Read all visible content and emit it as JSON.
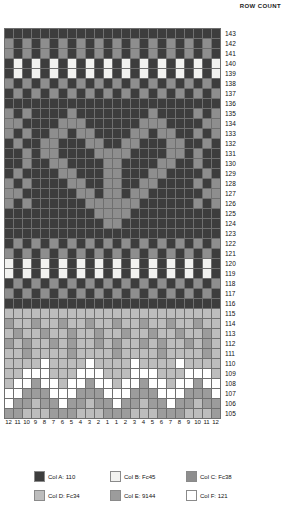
{
  "header": {
    "row_count_label": "ROW COUNT"
  },
  "chart_data": {
    "type": "heatmap",
    "title": "",
    "xlabel": "",
    "ylabel": "ROW COUNT",
    "grid": true,
    "legend_position": "bottom",
    "columns": 24,
    "rows": 39,
    "column_labels": [
      12,
      11,
      10,
      9,
      8,
      7,
      6,
      5,
      4,
      3,
      2,
      1,
      1,
      2,
      3,
      4,
      5,
      6,
      7,
      8,
      9,
      10,
      11,
      12
    ],
    "row_labels": [
      143,
      142,
      141,
      140,
      139,
      138,
      137,
      136,
      135,
      134,
      133,
      132,
      131,
      130,
      129,
      128,
      127,
      126,
      125,
      124,
      123,
      122,
      121,
      120,
      119,
      118,
      117,
      116,
      115,
      114,
      113,
      112,
      111,
      110,
      109,
      108,
      107,
      106,
      105
    ],
    "palette": {
      "A": "#3d3d3d",
      "B": "#f2f2f0",
      "C": "#8e8e8e",
      "D": "#bdbdbd",
      "E": "#9c9c9c",
      "F": "#ffffff"
    },
    "cells": [
      [
        "A",
        "A",
        "A",
        "A",
        "A",
        "A",
        "A",
        "A",
        "A",
        "A",
        "A",
        "A",
        "A",
        "A",
        "A",
        "A",
        "A",
        "A",
        "A",
        "A",
        "A",
        "A",
        "A",
        "A"
      ],
      [
        "C",
        "A",
        "C",
        "A",
        "C",
        "A",
        "C",
        "A",
        "C",
        "A",
        "C",
        "A",
        "C",
        "A",
        "C",
        "A",
        "C",
        "A",
        "C",
        "A",
        "C",
        "A",
        "C",
        "A"
      ],
      [
        "C",
        "A",
        "C",
        "A",
        "C",
        "A",
        "C",
        "A",
        "C",
        "A",
        "C",
        "A",
        "C",
        "A",
        "C",
        "A",
        "C",
        "A",
        "C",
        "A",
        "C",
        "A",
        "C",
        "A"
      ],
      [
        "A",
        "B",
        "A",
        "B",
        "A",
        "B",
        "A",
        "B",
        "A",
        "B",
        "A",
        "B",
        "A",
        "B",
        "A",
        "B",
        "A",
        "B",
        "A",
        "B",
        "A",
        "B",
        "A",
        "B"
      ],
      [
        "A",
        "B",
        "A",
        "B",
        "A",
        "B",
        "A",
        "B",
        "A",
        "B",
        "A",
        "B",
        "A",
        "B",
        "A",
        "B",
        "A",
        "B",
        "A",
        "B",
        "A",
        "B",
        "A",
        "B"
      ],
      [
        "C",
        "A",
        "C",
        "A",
        "C",
        "A",
        "C",
        "A",
        "C",
        "A",
        "C",
        "A",
        "C",
        "A",
        "C",
        "A",
        "C",
        "A",
        "C",
        "A",
        "C",
        "A",
        "C",
        "A"
      ],
      [
        "A",
        "C",
        "A",
        "C",
        "A",
        "C",
        "A",
        "C",
        "A",
        "C",
        "A",
        "C",
        "A",
        "C",
        "A",
        "C",
        "A",
        "C",
        "A",
        "C",
        "A",
        "C",
        "A",
        "C"
      ],
      [
        "A",
        "A",
        "A",
        "A",
        "A",
        "A",
        "A",
        "A",
        "A",
        "A",
        "A",
        "A",
        "A",
        "A",
        "A",
        "A",
        "A",
        "A",
        "A",
        "A",
        "A",
        "A",
        "A",
        "A"
      ],
      [
        "C",
        "A",
        "C",
        "A",
        "A",
        "A",
        "A",
        "C",
        "A",
        "A",
        "A",
        "A",
        "A",
        "A",
        "A",
        "A",
        "C",
        "A",
        "A",
        "A",
        "A",
        "C",
        "A",
        "C"
      ],
      [
        "C",
        "C",
        "A",
        "A",
        "A",
        "A",
        "C",
        "C",
        "C",
        "A",
        "A",
        "A",
        "A",
        "A",
        "A",
        "C",
        "C",
        "C",
        "A",
        "A",
        "A",
        "A",
        "C",
        "C"
      ],
      [
        "C",
        "A",
        "C",
        "A",
        "A",
        "C",
        "C",
        "A",
        "C",
        "C",
        "A",
        "A",
        "A",
        "A",
        "C",
        "C",
        "A",
        "C",
        "C",
        "A",
        "A",
        "C",
        "A",
        "C"
      ],
      [
        "A",
        "C",
        "A",
        "A",
        "C",
        "C",
        "A",
        "A",
        "A",
        "C",
        "C",
        "A",
        "A",
        "C",
        "C",
        "A",
        "A",
        "A",
        "C",
        "C",
        "A",
        "A",
        "C",
        "A"
      ],
      [
        "A",
        "A",
        "C",
        "A",
        "C",
        "C",
        "A",
        "A",
        "A",
        "A",
        "C",
        "C",
        "C",
        "C",
        "A",
        "A",
        "A",
        "A",
        "C",
        "C",
        "A",
        "C",
        "A",
        "A"
      ],
      [
        "A",
        "A",
        "C",
        "A",
        "A",
        "C",
        "C",
        "A",
        "A",
        "A",
        "A",
        "C",
        "C",
        "A",
        "A",
        "A",
        "A",
        "C",
        "C",
        "A",
        "A",
        "C",
        "A",
        "A"
      ],
      [
        "A",
        "C",
        "A",
        "A",
        "A",
        "A",
        "C",
        "C",
        "A",
        "A",
        "A",
        "C",
        "C",
        "A",
        "A",
        "A",
        "C",
        "C",
        "A",
        "A",
        "A",
        "A",
        "C",
        "A"
      ],
      [
        "C",
        "A",
        "C",
        "A",
        "A",
        "A",
        "A",
        "C",
        "C",
        "A",
        "A",
        "C",
        "C",
        "A",
        "A",
        "C",
        "C",
        "A",
        "A",
        "A",
        "A",
        "C",
        "A",
        "C"
      ],
      [
        "C",
        "C",
        "A",
        "A",
        "A",
        "A",
        "A",
        "A",
        "C",
        "C",
        "A",
        "C",
        "C",
        "A",
        "C",
        "C",
        "A",
        "A",
        "A",
        "A",
        "A",
        "A",
        "C",
        "C"
      ],
      [
        "C",
        "A",
        "C",
        "A",
        "A",
        "A",
        "A",
        "A",
        "A",
        "C",
        "C",
        "C",
        "C",
        "C",
        "C",
        "A",
        "A",
        "A",
        "A",
        "A",
        "A",
        "C",
        "A",
        "C"
      ],
      [
        "A",
        "A",
        "A",
        "A",
        "A",
        "A",
        "A",
        "A",
        "A",
        "A",
        "C",
        "C",
        "C",
        "C",
        "A",
        "A",
        "A",
        "A",
        "A",
        "A",
        "A",
        "A",
        "A",
        "A"
      ],
      [
        "A",
        "A",
        "A",
        "A",
        "A",
        "A",
        "A",
        "A",
        "A",
        "A",
        "A",
        "C",
        "C",
        "A",
        "A",
        "A",
        "A",
        "A",
        "A",
        "A",
        "A",
        "A",
        "A",
        "A"
      ],
      [
        "A",
        "A",
        "A",
        "A",
        "A",
        "A",
        "A",
        "A",
        "A",
        "A",
        "A",
        "A",
        "A",
        "A",
        "A",
        "A",
        "A",
        "A",
        "A",
        "A",
        "A",
        "A",
        "A",
        "A"
      ],
      [
        "A",
        "C",
        "A",
        "C",
        "A",
        "C",
        "A",
        "C",
        "A",
        "C",
        "A",
        "C",
        "A",
        "C",
        "A",
        "C",
        "A",
        "C",
        "A",
        "C",
        "A",
        "C",
        "A",
        "C"
      ],
      [
        "C",
        "A",
        "C",
        "A",
        "C",
        "A",
        "C",
        "A",
        "C",
        "A",
        "C",
        "A",
        "C",
        "A",
        "C",
        "A",
        "C",
        "A",
        "C",
        "A",
        "C",
        "A",
        "C",
        "A"
      ],
      [
        "B",
        "A",
        "B",
        "A",
        "B",
        "A",
        "B",
        "A",
        "B",
        "A",
        "B",
        "A",
        "B",
        "A",
        "B",
        "A",
        "B",
        "A",
        "B",
        "A",
        "B",
        "A",
        "B",
        "A"
      ],
      [
        "B",
        "A",
        "B",
        "A",
        "B",
        "A",
        "B",
        "A",
        "B",
        "A",
        "B",
        "A",
        "B",
        "A",
        "B",
        "A",
        "B",
        "A",
        "B",
        "A",
        "B",
        "A",
        "B",
        "A"
      ],
      [
        "A",
        "C",
        "A",
        "C",
        "A",
        "C",
        "A",
        "C",
        "A",
        "C",
        "A",
        "C",
        "A",
        "C",
        "A",
        "C",
        "A",
        "C",
        "A",
        "C",
        "A",
        "C",
        "A",
        "C"
      ],
      [
        "C",
        "A",
        "C",
        "A",
        "C",
        "A",
        "C",
        "A",
        "C",
        "A",
        "C",
        "A",
        "C",
        "A",
        "C",
        "A",
        "C",
        "A",
        "C",
        "A",
        "C",
        "A",
        "C",
        "A"
      ],
      [
        "A",
        "A",
        "A",
        "A",
        "A",
        "A",
        "A",
        "A",
        "A",
        "A",
        "A",
        "A",
        "A",
        "A",
        "A",
        "A",
        "A",
        "A",
        "A",
        "A",
        "A",
        "A",
        "A",
        "A"
      ],
      [
        "D",
        "D",
        "D",
        "D",
        "D",
        "D",
        "D",
        "D",
        "D",
        "D",
        "D",
        "D",
        "D",
        "D",
        "D",
        "D",
        "D",
        "D",
        "D",
        "D",
        "D",
        "D",
        "D",
        "D"
      ],
      [
        "E",
        "D",
        "D",
        "E",
        "D",
        "D",
        "E",
        "D",
        "D",
        "E",
        "D",
        "D",
        "E",
        "D",
        "D",
        "E",
        "D",
        "D",
        "E",
        "D",
        "D",
        "E",
        "D",
        "D"
      ],
      [
        "D",
        "E",
        "D",
        "D",
        "E",
        "D",
        "D",
        "E",
        "D",
        "D",
        "E",
        "D",
        "D",
        "E",
        "D",
        "D",
        "E",
        "D",
        "D",
        "E",
        "D",
        "D",
        "E",
        "D"
      ],
      [
        "E",
        "D",
        "E",
        "D",
        "D",
        "E",
        "D",
        "E",
        "D",
        "D",
        "E",
        "D",
        "E",
        "D",
        "D",
        "E",
        "D",
        "E",
        "D",
        "D",
        "E",
        "D",
        "E",
        "D"
      ],
      [
        "D",
        "D",
        "E",
        "D",
        "D",
        "D",
        "D",
        "E",
        "D",
        "D",
        "D",
        "D",
        "E",
        "D",
        "D",
        "D",
        "D",
        "E",
        "D",
        "D",
        "D",
        "D",
        "E",
        "D"
      ],
      [
        "D",
        "D",
        "D",
        "D",
        "F",
        "D",
        "D",
        "D",
        "D",
        "F",
        "D",
        "D",
        "D",
        "D",
        "F",
        "D",
        "D",
        "D",
        "D",
        "F",
        "D",
        "D",
        "D",
        "D"
      ],
      [
        "D",
        "D",
        "F",
        "F",
        "F",
        "D",
        "D",
        "D",
        "F",
        "F",
        "F",
        "D",
        "D",
        "D",
        "F",
        "F",
        "F",
        "D",
        "D",
        "D",
        "F",
        "F",
        "F",
        "D"
      ],
      [
        "D",
        "F",
        "F",
        "E",
        "F",
        "F",
        "D",
        "F",
        "F",
        "E",
        "F",
        "F",
        "D",
        "F",
        "F",
        "E",
        "F",
        "F",
        "D",
        "F",
        "F",
        "E",
        "F",
        "F"
      ],
      [
        "F",
        "F",
        "E",
        "E",
        "E",
        "F",
        "F",
        "F",
        "E",
        "E",
        "E",
        "F",
        "F",
        "F",
        "E",
        "E",
        "E",
        "F",
        "F",
        "F",
        "E",
        "E",
        "E",
        "F"
      ],
      [
        "F",
        "E",
        "E",
        "D",
        "E",
        "E",
        "F",
        "E",
        "E",
        "D",
        "E",
        "E",
        "F",
        "E",
        "E",
        "D",
        "E",
        "E",
        "F",
        "E",
        "E",
        "D",
        "E",
        "E"
      ],
      [
        "E",
        "E",
        "D",
        "D",
        "D",
        "E",
        "E",
        "E",
        "D",
        "D",
        "D",
        "E",
        "E",
        "E",
        "D",
        "D",
        "D",
        "E",
        "E",
        "E",
        "D",
        "D",
        "D",
        "E"
      ]
    ]
  },
  "legend": {
    "items": [
      {
        "key": "A",
        "label": "Col A: 110",
        "color": "#3d3d3d"
      },
      {
        "key": "B",
        "label": "Col B: Fc45",
        "color": "#f2f2f0"
      },
      {
        "key": "C",
        "label": "Col C: Fc38",
        "color": "#8e8e8e"
      },
      {
        "key": "D",
        "label": "Col D: Fc34",
        "color": "#bdbdbd"
      },
      {
        "key": "E",
        "label": "Col E: 9144",
        "color": "#9c9c9c"
      },
      {
        "key": "F",
        "label": "Col F: 121",
        "color": "#ffffff"
      }
    ]
  }
}
